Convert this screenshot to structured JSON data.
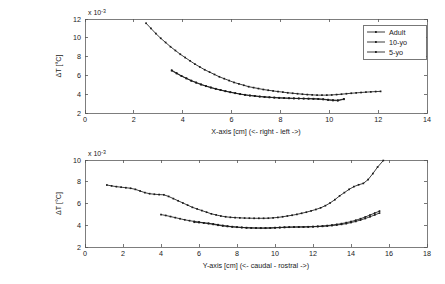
{
  "figure": {
    "background_color": "#ffffff",
    "line_color": "#1a1a1a",
    "grid_color": "#c8c8c8",
    "frame_color": "#7d7d7d"
  },
  "legend": {
    "position": "top-right",
    "entries": [
      {
        "label": "Adult",
        "style": "solid-dotted"
      },
      {
        "label": "10-yo",
        "style": "solid-dotted"
      },
      {
        "label": "5-yo",
        "style": "solid-dotted"
      }
    ]
  },
  "chart_data": [
    {
      "type": "line",
      "panel": "top",
      "title": "",
      "xlabel": "X-axis [cm] (<- right  - left ->)",
      "ylabel": "ΔT [°C]",
      "y_multiplier": "x 10",
      "y_multiplier_exponent": "-3",
      "xlim": [
        0,
        14
      ],
      "ylim": [
        2,
        12
      ],
      "xticks": [
        0,
        2,
        4,
        6,
        8,
        10,
        12,
        14
      ],
      "yticks": [
        2,
        4,
        6,
        8,
        10,
        12
      ],
      "grid": true,
      "legend_position": "upper right",
      "series": [
        {
          "name": "Adult",
          "x": [
            2.5,
            2.7,
            2.9,
            3.1,
            3.3,
            3.5,
            3.7,
            3.9,
            4.1,
            4.3,
            4.5,
            4.7,
            4.9,
            5.1,
            5.3,
            5.5,
            5.7,
            5.9,
            6.1,
            6.3,
            6.5,
            6.7,
            6.9,
            7.1,
            7.3,
            7.5,
            7.7,
            7.9,
            8.1,
            8.3,
            8.5,
            8.7,
            8.9,
            9.1,
            9.3,
            9.5,
            9.7,
            9.9,
            10.1,
            10.3,
            10.5,
            10.7,
            10.9,
            11.1,
            11.3,
            11.5,
            11.7,
            11.9,
            12.1
          ],
          "y": [
            11.55,
            11.0,
            10.45,
            9.95,
            9.5,
            9.05,
            8.65,
            8.25,
            7.9,
            7.55,
            7.2,
            6.9,
            6.6,
            6.35,
            6.1,
            5.85,
            5.65,
            5.45,
            5.25,
            5.1,
            4.95,
            4.8,
            4.7,
            4.6,
            4.5,
            4.42,
            4.35,
            4.28,
            4.22,
            4.15,
            4.1,
            4.05,
            4.0,
            3.96,
            3.93,
            3.9,
            3.9,
            3.9,
            3.92,
            3.96,
            4.0,
            4.05,
            4.1,
            4.14,
            4.18,
            4.22,
            4.25,
            4.28,
            4.3
          ]
        },
        {
          "name": "10-yo",
          "x": [
            3.55,
            3.75,
            3.95,
            4.15,
            4.35,
            4.55,
            4.75,
            4.95,
            5.15,
            5.35,
            5.55,
            5.75,
            5.95,
            6.15,
            6.35,
            6.55,
            6.75,
            6.95,
            7.15,
            7.35,
            7.55,
            7.75,
            7.95,
            8.15,
            8.35,
            8.55,
            8.75,
            8.95,
            9.15,
            9.35,
            9.55,
            9.75,
            9.95,
            10.15,
            10.35,
            10.6
          ],
          "y": [
            6.55,
            6.25,
            5.95,
            5.7,
            5.45,
            5.25,
            5.05,
            4.88,
            4.72,
            4.58,
            4.45,
            4.33,
            4.22,
            4.12,
            4.02,
            3.94,
            3.87,
            3.82,
            3.76,
            3.72,
            3.68,
            3.65,
            3.62,
            3.6,
            3.58,
            3.56,
            3.55,
            3.54,
            3.53,
            3.52,
            3.5,
            3.47,
            3.42,
            3.38,
            3.36,
            3.5
          ]
        },
        {
          "name": "5-yo",
          "x": [
            3.55,
            3.75,
            3.95,
            4.15,
            4.35,
            4.55,
            4.75,
            4.95,
            5.15,
            5.35,
            5.55,
            5.75,
            5.95,
            6.15,
            6.35,
            6.55,
            6.75,
            6.95,
            7.15,
            7.35,
            7.55,
            7.75,
            7.95,
            8.15,
            8.35,
            8.55,
            8.75,
            8.95,
            9.15,
            9.35,
            9.55,
            9.75,
            9.95,
            10.15,
            10.35,
            10.6
          ],
          "y": [
            6.5,
            6.2,
            5.92,
            5.67,
            5.43,
            5.22,
            5.02,
            4.85,
            4.7,
            4.56,
            4.43,
            4.31,
            4.2,
            4.1,
            4.0,
            3.92,
            3.85,
            3.8,
            3.74,
            3.7,
            3.66,
            3.63,
            3.6,
            3.58,
            3.56,
            3.55,
            3.54,
            3.53,
            3.52,
            3.5,
            3.48,
            3.44,
            3.38,
            3.33,
            3.31,
            3.46
          ]
        }
      ]
    },
    {
      "type": "line",
      "panel": "bottom",
      "title": "",
      "xlabel": "Y-axis [cm] (<- caudal - rostral ->)",
      "ylabel": "ΔT [°C]",
      "y_multiplier": "x 10",
      "y_multiplier_exponent": "-3",
      "xlim": [
        0,
        18
      ],
      "ylim": [
        2,
        10
      ],
      "xticks": [
        0,
        2,
        4,
        6,
        8,
        10,
        12,
        14,
        16,
        18
      ],
      "yticks": [
        2,
        4,
        6,
        8,
        10
      ],
      "grid": true,
      "series": [
        {
          "name": "Adult",
          "x": [
            1.15,
            1.4,
            1.65,
            1.9,
            2.15,
            2.4,
            2.65,
            2.9,
            3.15,
            3.4,
            3.65,
            3.9,
            4.15,
            4.4,
            4.65,
            4.9,
            5.15,
            5.4,
            5.65,
            5.9,
            6.15,
            6.4,
            6.65,
            6.9,
            7.15,
            7.4,
            7.65,
            7.9,
            8.15,
            8.4,
            8.65,
            8.9,
            9.15,
            9.4,
            9.65,
            9.9,
            10.15,
            10.4,
            10.65,
            10.9,
            11.15,
            11.4,
            11.65,
            11.9,
            12.15,
            12.4,
            12.65,
            12.9,
            13.15,
            13.4,
            13.65,
            13.9,
            14.15,
            14.4,
            14.65,
            14.9,
            15.15,
            15.4,
            15.7
          ],
          "y": [
            7.7,
            7.62,
            7.55,
            7.5,
            7.45,
            7.4,
            7.3,
            7.15,
            7.0,
            6.9,
            6.85,
            6.82,
            6.8,
            6.65,
            6.45,
            6.25,
            6.05,
            5.85,
            5.65,
            5.5,
            5.35,
            5.2,
            5.05,
            4.95,
            4.85,
            4.78,
            4.73,
            4.7,
            4.68,
            4.66,
            4.65,
            4.64,
            4.64,
            4.64,
            4.65,
            4.68,
            4.72,
            4.78,
            4.85,
            4.92,
            5.0,
            5.1,
            5.2,
            5.32,
            5.45,
            5.6,
            5.8,
            6.05,
            6.35,
            6.7,
            7.0,
            7.3,
            7.55,
            7.72,
            7.85,
            8.2,
            8.75,
            9.35,
            9.95
          ]
        },
        {
          "name": "10-yo",
          "x": [
            4.0,
            4.25,
            4.5,
            4.75,
            5.0,
            5.25,
            5.5,
            5.75,
            6.0,
            6.25,
            6.5,
            6.75,
            7.0,
            7.25,
            7.5,
            7.75,
            8.0,
            8.25,
            8.5,
            8.75,
            9.0,
            9.25,
            9.5,
            9.75,
            10.0,
            10.25,
            10.5,
            10.75,
            11.0,
            11.25,
            11.5,
            11.75,
            12.0,
            12.25,
            12.5,
            12.75,
            13.0,
            13.25,
            13.5,
            13.75,
            14.0,
            14.25,
            14.5,
            14.75,
            15.0,
            15.25,
            15.5
          ],
          "y": [
            4.98,
            4.9,
            4.8,
            4.7,
            4.6,
            4.5,
            4.42,
            4.35,
            4.3,
            4.22,
            4.15,
            4.08,
            4.0,
            3.94,
            3.89,
            3.85,
            3.82,
            3.79,
            3.77,
            3.76,
            3.75,
            3.75,
            3.75,
            3.76,
            3.78,
            3.8,
            3.82,
            3.83,
            3.84,
            3.84,
            3.84,
            3.85,
            3.86,
            3.88,
            3.9,
            3.93,
            3.97,
            4.02,
            4.08,
            4.15,
            4.25,
            4.35,
            4.48,
            4.62,
            4.78,
            4.95,
            5.12
          ]
        },
        {
          "name": "5-yo",
          "x": [
            5.75,
            6.0,
            6.25,
            6.5,
            6.75,
            7.0,
            7.25,
            7.5,
            7.75,
            8.0,
            8.25,
            8.5,
            8.75,
            9.0,
            9.25,
            9.5,
            9.75,
            10.0,
            10.25,
            10.5,
            10.75,
            11.0,
            11.25,
            11.5,
            11.75,
            12.0,
            12.25,
            12.5,
            12.75,
            13.0,
            13.25,
            13.5,
            13.75,
            14.0,
            14.25,
            14.5,
            14.75,
            15.0,
            15.25,
            15.5
          ],
          "y": [
            4.28,
            4.25,
            4.22,
            4.18,
            4.12,
            4.05,
            3.98,
            3.92,
            3.87,
            3.83,
            3.8,
            3.77,
            3.75,
            3.74,
            3.73,
            3.73,
            3.74,
            3.76,
            3.78,
            3.8,
            3.82,
            3.83,
            3.84,
            3.85,
            3.86,
            3.88,
            3.9,
            3.93,
            3.97,
            4.02,
            4.08,
            4.15,
            4.24,
            4.34,
            4.46,
            4.6,
            4.76,
            4.94,
            5.12,
            5.3
          ]
        }
      ]
    }
  ]
}
